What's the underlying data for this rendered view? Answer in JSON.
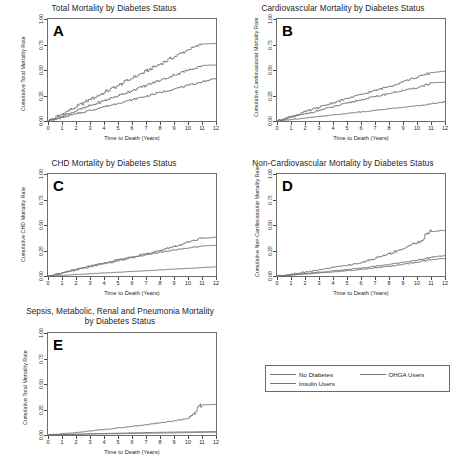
{
  "figure": {
    "x_axis_label": "Time to Death (Years)",
    "x_ticks": [
      "0",
      "1",
      "2",
      "3",
      "4",
      "5",
      "6",
      "7",
      "8",
      "9",
      "10",
      "11",
      "12"
    ],
    "y_ticks": [
      "0.00",
      "0.25",
      "0.50",
      "0.75",
      "1.00"
    ]
  },
  "panels": {
    "a": {
      "letter": "A",
      "title": "Total Mortality by Diabetes Status",
      "y_axis_label": "Cumulative Total Mortality Rate"
    },
    "b": {
      "letter": "B",
      "title": "Cardiovascular Mortality by Diabetes Status",
      "y_axis_label": "Cumulative Cardiovascular Mortality Rate"
    },
    "c": {
      "letter": "C",
      "title": "CHD Mortality by Diabetes Status",
      "y_axis_label": "Cumulative CHD Mortality Rate"
    },
    "d": {
      "letter": "D",
      "title": "Non-Cardiovascular Mortality by Diabetes Status",
      "y_axis_label": "Cumulative Non-Cardiovascular Mortality Rate"
    },
    "e": {
      "letter": "E",
      "title": "Sepsis, Metabolic, Renal and Pneumonia Mortality\nby Diabetes Status",
      "y_axis_label": "Cumulative Total Mortality Rate"
    }
  },
  "legend": {
    "items": [
      {
        "label": "No Diabetes",
        "color": "#777777"
      },
      {
        "label": "OHGA Users",
        "color": "#777777"
      },
      {
        "label": "Insulin Users",
        "color": "#777777"
      }
    ]
  },
  "chart_data": [
    {
      "type": "line",
      "panel": "A",
      "title": "Total Mortality by Diabetes Status",
      "xlabel": "Time to Death (Years)",
      "ylabel": "Cumulative Total Mortality Rate",
      "xlim": [
        0,
        12
      ],
      "ylim": [
        0,
        1
      ],
      "grid": false,
      "legend_position": "external-bottom-right",
      "x": [
        0,
        1,
        2,
        3,
        4,
        5,
        6,
        7,
        8,
        9,
        10,
        11,
        12
      ],
      "series": [
        {
          "name": "Insulin Users",
          "values": [
            0.0,
            0.07,
            0.14,
            0.21,
            0.28,
            0.35,
            0.42,
            0.49,
            0.56,
            0.63,
            0.7,
            0.755,
            0.76
          ]
        },
        {
          "name": "OHGA Users",
          "values": [
            0.0,
            0.05,
            0.1,
            0.15,
            0.2,
            0.25,
            0.3,
            0.35,
            0.4,
            0.45,
            0.5,
            0.545,
            0.55
          ]
        },
        {
          "name": "No Diabetes",
          "values": [
            0.0,
            0.035,
            0.07,
            0.105,
            0.14,
            0.175,
            0.21,
            0.245,
            0.28,
            0.315,
            0.35,
            0.385,
            0.42
          ]
        }
      ]
    },
    {
      "type": "line",
      "panel": "B",
      "title": "Cardiovascular Mortality by Diabetes Status",
      "xlabel": "Time to Death (Years)",
      "ylabel": "Cumulative Cardiovascular Mortality Rate",
      "xlim": [
        0,
        12
      ],
      "ylim": [
        0,
        1
      ],
      "grid": false,
      "x": [
        0,
        1,
        2,
        3,
        4,
        5,
        6,
        7,
        8,
        9,
        10,
        11,
        12
      ],
      "series": [
        {
          "name": "Insulin Users",
          "values": [
            0.0,
            0.045,
            0.09,
            0.135,
            0.18,
            0.22,
            0.26,
            0.3,
            0.34,
            0.39,
            0.43,
            0.475,
            0.49
          ]
        },
        {
          "name": "OHGA Users",
          "values": [
            0.0,
            0.035,
            0.07,
            0.105,
            0.14,
            0.175,
            0.21,
            0.24,
            0.27,
            0.3,
            0.325,
            0.375,
            0.38
          ]
        },
        {
          "name": "No Diabetes",
          "values": [
            0.0,
            0.015,
            0.03,
            0.045,
            0.06,
            0.075,
            0.09,
            0.105,
            0.12,
            0.135,
            0.15,
            0.17,
            0.19
          ]
        }
      ]
    },
    {
      "type": "line",
      "panel": "C",
      "title": "CHD Mortality by Diabetes Status",
      "xlabel": "Time to Death (Years)",
      "ylabel": "Cumulative CHD Mortality Rate",
      "xlim": [
        0,
        12
      ],
      "ylim": [
        0,
        1
      ],
      "grid": false,
      "x": [
        0,
        1,
        2,
        3,
        4,
        5,
        6,
        7,
        8,
        9,
        10,
        11,
        12
      ],
      "series": [
        {
          "name": "Insulin Users",
          "values": [
            0.0,
            0.035,
            0.065,
            0.1,
            0.13,
            0.16,
            0.19,
            0.22,
            0.25,
            0.29,
            0.33,
            0.37,
            0.38
          ]
        },
        {
          "name": "OHGA Users",
          "values": [
            0.0,
            0.03,
            0.06,
            0.09,
            0.12,
            0.15,
            0.18,
            0.21,
            0.235,
            0.255,
            0.275,
            0.295,
            0.3
          ]
        },
        {
          "name": "No Diabetes",
          "values": [
            0.0,
            0.007,
            0.015,
            0.022,
            0.03,
            0.037,
            0.045,
            0.052,
            0.06,
            0.068,
            0.075,
            0.083,
            0.09
          ]
        }
      ]
    },
    {
      "type": "line",
      "panel": "D",
      "title": "Non-Cardiovascular Mortality by Diabetes Status",
      "xlabel": "Time to Death (Years)",
      "ylabel": "Cumulative Non-Cardiovascular Mortality Rate",
      "xlim": [
        0,
        12
      ],
      "ylim": [
        0,
        1
      ],
      "grid": false,
      "x": [
        0,
        1,
        2,
        3,
        4,
        5,
        6,
        7,
        8,
        9,
        10,
        11,
        12
      ],
      "series": [
        {
          "name": "Insulin Users",
          "values": [
            0.0,
            0.02,
            0.04,
            0.06,
            0.085,
            0.105,
            0.13,
            0.175,
            0.22,
            0.27,
            0.33,
            0.435,
            0.45
          ]
        },
        {
          "name": "OHGA Users",
          "values": [
            0.0,
            0.012,
            0.025,
            0.038,
            0.05,
            0.065,
            0.078,
            0.095,
            0.115,
            0.135,
            0.155,
            0.185,
            0.2
          ]
        },
        {
          "name": "No Diabetes",
          "values": [
            0.0,
            0.009,
            0.019,
            0.03,
            0.04,
            0.052,
            0.065,
            0.08,
            0.095,
            0.115,
            0.135,
            0.16,
            0.175
          ]
        }
      ]
    },
    {
      "type": "line",
      "panel": "E",
      "title": "Sepsis, Metabolic, Renal and Pneumonia Mortality by Diabetes Status",
      "xlabel": "Time to Death (Years)",
      "ylabel": "Cumulative Total Mortality Rate",
      "xlim": [
        0,
        12
      ],
      "ylim": [
        0,
        1
      ],
      "grid": false,
      "x": [
        0,
        1,
        2,
        3,
        4,
        5,
        6,
        7,
        8,
        9,
        10,
        11,
        12
      ],
      "series": [
        {
          "name": "Insulin Users",
          "values": [
            0.0,
            0.012,
            0.025,
            0.04,
            0.055,
            0.07,
            0.085,
            0.1,
            0.12,
            0.14,
            0.165,
            0.295,
            0.3
          ]
        },
        {
          "name": "OHGA Users",
          "values": [
            0.0,
            0.004,
            0.008,
            0.012,
            0.015,
            0.018,
            0.021,
            0.024,
            0.027,
            0.029,
            0.031,
            0.033,
            0.035
          ]
        },
        {
          "name": "No Diabetes",
          "values": [
            0.0,
            0.003,
            0.006,
            0.009,
            0.011,
            0.013,
            0.015,
            0.017,
            0.019,
            0.021,
            0.023,
            0.025,
            0.027
          ]
        }
      ]
    }
  ]
}
